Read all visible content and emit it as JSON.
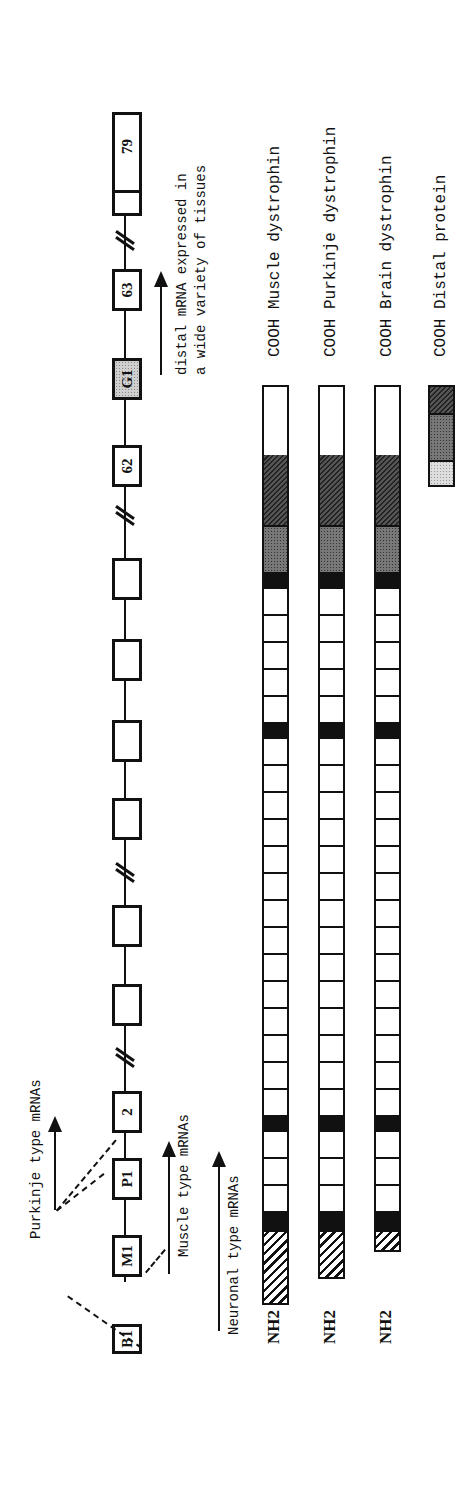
{
  "figure": {
    "orientation": "rotated 90 degrees counter-clockwise",
    "gene_map": {
      "exons": [
        {
          "label": "B1",
          "type": "promoter-exon"
        },
        {
          "label": "M1",
          "type": "promoter-exon"
        },
        {
          "label": "P1",
          "type": "promoter-exon"
        },
        {
          "label": "2",
          "type": "exon"
        },
        {
          "label": "",
          "type": "exon"
        },
        {
          "label": "",
          "type": "exon"
        },
        {
          "label": "",
          "type": "exon"
        },
        {
          "label": "",
          "type": "exon"
        },
        {
          "label": "",
          "type": "exon"
        },
        {
          "label": "62",
          "type": "exon"
        },
        {
          "label": "G1",
          "type": "distal-promoter-exon"
        },
        {
          "label": "63",
          "type": "exon"
        },
        {
          "label": "79",
          "type": "exon"
        }
      ],
      "annotations": {
        "purkinje": "Purkinje type mRNAs",
        "muscle": "Muscle type mRNAs",
        "neuronal": "Neuronal type mRNAs",
        "distal_line1": "distal mRNA expressed in",
        "distal_line2": "a wide variety of tissues"
      }
    },
    "proteins": [
      {
        "nterm": "NH2",
        "cterm": "COOH",
        "name": "Muscle dystrophin"
      },
      {
        "nterm": "NH2",
        "cterm": "COOH",
        "name": "Purkinje dystrophin"
      },
      {
        "nterm": "NH2",
        "cterm": "COOH",
        "name": "Brain dystrophin"
      },
      {
        "nterm": "",
        "cterm": "COOH",
        "name": "Distal protein"
      }
    ],
    "colors": {
      "ink": "#111111",
      "background": "#ffffff",
      "stipple": "#cfcfcf"
    }
  }
}
